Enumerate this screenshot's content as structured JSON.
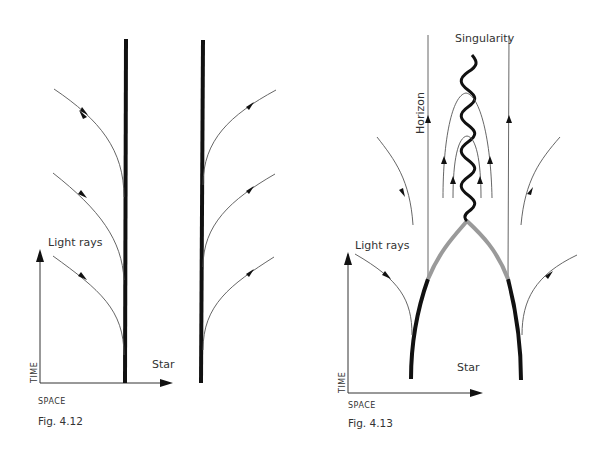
{
  "figures": [
    {
      "id": "fig-4-12",
      "caption": "Fig. 4.12",
      "axis_time_label": "TIME",
      "axis_space_label": "SPACE",
      "light_rays_label": "Light rays",
      "star_label": "Star"
    },
    {
      "id": "fig-4-13",
      "caption": "Fig. 4.13",
      "axis_time_label": "TIME",
      "axis_space_label": "SPACE",
      "light_rays_label": "Light rays",
      "star_label": "Star",
      "singularity_label": "Singularity",
      "horizon_label": "Horizon"
    }
  ],
  "colors": {
    "star_worldline": "#111111",
    "collapse_surface": "#9a9a9a",
    "ray": "#555555",
    "text": "#333333"
  }
}
